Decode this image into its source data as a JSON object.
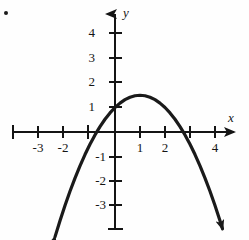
{
  "figure": {
    "marker_label": "bullet-dot",
    "axis_labels": {
      "x": "x",
      "y": "y"
    }
  },
  "chart_data": {
    "type": "line",
    "title": "",
    "xlabel": "x",
    "ylabel": "y",
    "grid": false,
    "legend": null,
    "xlim": [
      -4.1,
      5.0
    ],
    "ylim": [
      -3.9,
      4.9
    ],
    "x_ticks": [
      -4,
      -3,
      -2,
      -1,
      1,
      2,
      3,
      4
    ],
    "x_tick_labels": [
      "",
      "-3",
      "-2",
      "",
      "1",
      "2",
      "",
      "4"
    ],
    "y_ticks": [
      4,
      3,
      2,
      1,
      -1,
      -2,
      -3
    ],
    "y_tick_labels": [
      "4",
      "3",
      "2",
      "1",
      "-1",
      "-2",
      "-3"
    ],
    "curve": {
      "name": "downward parabola",
      "equation": "y = -0.5x^2 + x + 1",
      "vertex": [
        1,
        1.5
      ],
      "y_intercept": 1,
      "x_intercepts": [
        -0.73,
        2.73
      ],
      "opens": "down",
      "arrow_ends": [
        [
          -2.4,
          -3.9
        ],
        [
          4.3,
          -3.95
        ]
      ],
      "points": [
        [
          -2.4,
          -4.28
        ],
        [
          -2.2,
          -3.62
        ],
        [
          -2.0,
          -3.0
        ],
        [
          -1.8,
          -2.42
        ],
        [
          -1.6,
          -1.88
        ],
        [
          -1.4,
          -1.38
        ],
        [
          -1.2,
          -0.92
        ],
        [
          -1.0,
          -0.5
        ],
        [
          -0.8,
          -0.12
        ],
        [
          -0.6,
          0.22
        ],
        [
          -0.4,
          0.52
        ],
        [
          -0.2,
          0.78
        ],
        [
          0.0,
          1.0
        ],
        [
          0.2,
          1.18
        ],
        [
          0.4,
          1.32
        ],
        [
          0.6,
          1.42
        ],
        [
          0.8,
          1.48
        ],
        [
          1.0,
          1.5
        ],
        [
          1.2,
          1.48
        ],
        [
          1.4,
          1.42
        ],
        [
          1.6,
          1.32
        ],
        [
          1.8,
          1.18
        ],
        [
          2.0,
          1.0
        ],
        [
          2.2,
          0.78
        ],
        [
          2.4,
          0.52
        ],
        [
          2.6,
          0.22
        ],
        [
          2.8,
          -0.12
        ],
        [
          3.0,
          -0.5
        ],
        [
          3.2,
          -0.92
        ],
        [
          3.4,
          -1.38
        ],
        [
          3.6,
          -1.88
        ],
        [
          3.8,
          -2.42
        ],
        [
          4.0,
          -3.0
        ],
        [
          4.2,
          -3.62
        ],
        [
          4.3,
          -3.95
        ]
      ]
    }
  },
  "geometry": {
    "origin_px": [
      115,
      132
    ],
    "unit_px_x": 25,
    "unit_px_y": 24.5,
    "x_axis_from_px": 13,
    "x_axis_to_px": 240,
    "y_axis_from_px": 10,
    "y_axis_to_px": 230
  },
  "colors": {
    "ink": "#141414",
    "curve": "#1a1a1a",
    "background": "#fefefe"
  }
}
